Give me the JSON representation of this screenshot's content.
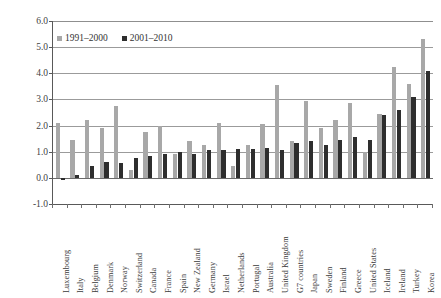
{
  "chart_data": {
    "type": "bar",
    "title": "",
    "subtitle": "",
    "xlabel": "",
    "ylabel": "",
    "ylim": [
      -1.0,
      6.0
    ],
    "ytick_step": 1.0,
    "yticks": [
      "6.0",
      "5.0",
      "4.0",
      "3.0",
      "2.0",
      "1.0",
      "0.0",
      "-1.0"
    ],
    "ytick_values": [
      6.0,
      5.0,
      4.0,
      3.0,
      2.0,
      1.0,
      0.0,
      -1.0
    ],
    "grid": "horizontal",
    "legend_position": "top-left",
    "categories": [
      "Luxembourg",
      "Italy",
      "Belgium",
      "Denmark",
      "Norway",
      "Switzerland",
      "Canada",
      "France",
      "Spain",
      "New Zealand",
      "Germany",
      "Israel",
      "Netherlands",
      "Portugal",
      "Australia",
      "United Kingdom",
      "G7 countries",
      "Japan",
      "Sweden",
      "Finland",
      "Greece",
      "United States",
      "Iceland",
      "Ireland",
      "Turkey",
      "Korea"
    ],
    "series": [
      {
        "name": "1991-2000",
        "color": "#a8a8a8",
        "values": [
          2.1,
          1.45,
          2.2,
          1.9,
          2.75,
          0.3,
          1.75,
          2.0,
          0.9,
          1.4,
          1.25,
          2.1,
          0.45,
          1.25,
          2.05,
          3.55,
          1.4,
          2.95,
          1.9,
          2.2,
          2.85,
          1.0,
          2.45,
          4.25,
          3.6,
          5.3
        ]
      },
      {
        "name": "2001-2010",
        "color": "#2e2e2e",
        "values": [
          -0.1,
          0.1,
          0.45,
          0.6,
          0.55,
          0.75,
          0.85,
          0.9,
          1.0,
          0.9,
          1.05,
          1.05,
          1.1,
          1.1,
          1.15,
          1.05,
          1.35,
          1.4,
          1.25,
          1.45,
          1.55,
          1.45,
          2.4,
          2.6,
          3.1,
          4.1
        ]
      }
    ]
  },
  "legend": {
    "entries": [
      {
        "label": "1991–2000",
        "color": "#a8a8a8"
      },
      {
        "label": "2001–2010",
        "color": "#2e2e2e"
      }
    ]
  }
}
